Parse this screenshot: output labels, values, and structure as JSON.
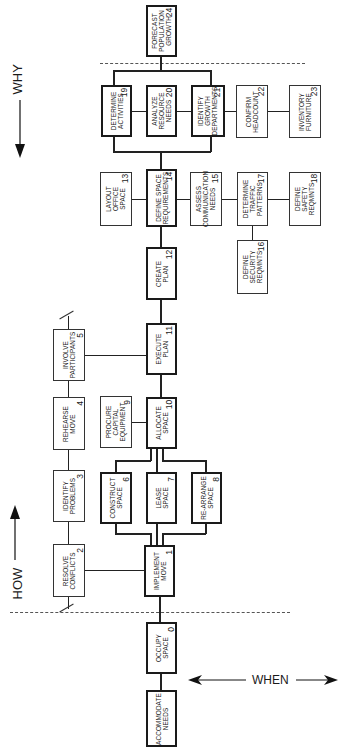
{
  "diagram": {
    "type": "FAST diagram (function analysis)",
    "axis_labels": {
      "how": "HOW",
      "why": "WHY",
      "when": "WHEN"
    },
    "nodes": [
      {
        "id": 24,
        "label_lines": [
          "FORECAST",
          "POPULATION",
          "GROWTH"
        ],
        "num": "24"
      },
      {
        "id": 19,
        "label_lines": [
          "DETERMINE",
          "ACTIVITIES"
        ],
        "num": "19"
      },
      {
        "id": 20,
        "label_lines": [
          "ANALYZE",
          "RESOURCE",
          "NEEDS"
        ],
        "num": "20"
      },
      {
        "id": 21,
        "label_lines": [
          "IDENTIFY",
          "GROWTH",
          "DEPARTMENTS"
        ],
        "num": "21"
      },
      {
        "id": 22,
        "label_lines": [
          "CONFIRM",
          "HEADCOUNT"
        ],
        "num": "22"
      },
      {
        "id": 23,
        "label_lines": [
          "INVENTORY",
          "FURNITURE"
        ],
        "num": "23"
      },
      {
        "id": 13,
        "label_lines": [
          "LAYOUT",
          "OFFICE",
          "SPACE"
        ],
        "num": "13"
      },
      {
        "id": 14,
        "label_lines": [
          "DEFINE SPACE",
          "REQUIREMENTS"
        ],
        "num": "14"
      },
      {
        "id": 15,
        "label_lines": [
          "ASSESS",
          "COMMUNICATION",
          "NEEDS"
        ],
        "num": "15"
      },
      {
        "id": 17,
        "label_lines": [
          "DETERMINE",
          "TRAFFIC",
          "PATTERNS"
        ],
        "num": "17"
      },
      {
        "id": 18,
        "label_lines": [
          "DEFINE",
          "SAFETY",
          "REQMNTS"
        ],
        "num": "18"
      },
      {
        "id": 16,
        "label_lines": [
          "DEFINE",
          "SECURITY",
          "REQMNTS"
        ],
        "num": "16"
      },
      {
        "id": 12,
        "label_lines": [
          "CREATE",
          "PLAN"
        ],
        "num": "12"
      },
      {
        "id": 11,
        "label_lines": [
          "EXECUTE",
          "PLAN"
        ],
        "num": "11"
      },
      {
        "id": 5,
        "label_lines": [
          "INVOLVE",
          "PARTICIPANTS"
        ],
        "num": "5"
      },
      {
        "id": 4,
        "label_lines": [
          "REHEARSE",
          "MOVE"
        ],
        "num": "4"
      },
      {
        "id": 3,
        "label_lines": [
          "IDENTIFY",
          "PROBLEMS"
        ],
        "num": "3"
      },
      {
        "id": 2,
        "label_lines": [
          "RESOLVE",
          "CONFLICTS"
        ],
        "num": "2"
      },
      {
        "id": 9,
        "label_lines": [
          "PROCURE",
          "CAPITAL",
          "EQUIPMENT"
        ],
        "num": "9"
      },
      {
        "id": 10,
        "label_lines": [
          "ALLOCATE",
          "SPACE"
        ],
        "num": "10"
      },
      {
        "id": 6,
        "label_lines": [
          "CONSTRUCT",
          "SPACE"
        ],
        "num": "6"
      },
      {
        "id": 7,
        "label_lines": [
          "LEASE",
          "SPACE"
        ],
        "num": "7"
      },
      {
        "id": 8,
        "label_lines": [
          "RE-ARRANGE",
          "SPACE"
        ],
        "num": "8"
      },
      {
        "id": 1,
        "label_lines": [
          "IMPLEMENT",
          "MOVE"
        ],
        "num": "1"
      },
      {
        "id": 0,
        "label_lines": [
          "OCCUPY",
          "SPACE"
        ],
        "num": "0"
      },
      {
        "id": "basic",
        "label_lines": [
          "ACCOMMODATE",
          "NEEDS"
        ],
        "num": ""
      }
    ],
    "n": {
      "24": {
        "l1": "FORECAST",
        "l2": "POPULATION",
        "l3": "GROWTH",
        "num": "24"
      },
      "19": {
        "l1": "DETERMINE",
        "l2": "ACTIVITIES",
        "num": "19"
      },
      "20": {
        "l1": "ANALYZE",
        "l2": "RESOURCE",
        "l3": "NEEDS",
        "num": "20"
      },
      "21": {
        "l1": "IDENTIFY",
        "l2": "GROWTH",
        "l3": "DEPARTMENTS",
        "num": "21"
      },
      "22": {
        "l1": "CONFIRM",
        "l2": "HEADCOUNT",
        "num": "22"
      },
      "23": {
        "l1": "INVENTORY",
        "l2": "FURNITURE",
        "num": "23"
      },
      "13": {
        "l1": "LAYOUT",
        "l2": "OFFICE",
        "l3": "SPACE",
        "num": "13"
      },
      "14": {
        "l1": "DEFINE SPACE",
        "l2": "REQUIREMENTS",
        "num": "14"
      },
      "15": {
        "l1": "ASSESS",
        "l2": "COMMUNICATION",
        "l3": "NEEDS",
        "num": "15"
      },
      "17": {
        "l1": "DETERMINE",
        "l2": "TRAFFIC",
        "l3": "PATTERNS",
        "num": "17"
      },
      "18": {
        "l1": "DEFINE",
        "l2": "SAFETY",
        "l3": "REQMNTS",
        "num": "18"
      },
      "16": {
        "l1": "DEFINE",
        "l2": "SECURITY",
        "l3": "REQMNTS",
        "num": "16"
      },
      "12": {
        "l1": "CREATE",
        "l2": "PLAN",
        "num": "12"
      },
      "11": {
        "l1": "EXECUTE",
        "l2": "PLAN",
        "num": "11"
      },
      "5": {
        "l1": "INVOLVE",
        "l2": "PARTICIPANTS",
        "num": "5"
      },
      "4": {
        "l1": "REHEARSE",
        "l2": "MOVE",
        "num": "4"
      },
      "3": {
        "l1": "IDENTIFY",
        "l2": "PROBLEMS",
        "num": "3"
      },
      "2": {
        "l1": "RESOLVE",
        "l2": "CONFLICTS",
        "num": "2"
      },
      "9": {
        "l1": "PROCURE",
        "l2": "CAPITAL",
        "l3": "EQUIPMENT",
        "num": "9"
      },
      "10": {
        "l1": "ALLOCATE",
        "l2": "SPACE",
        "num": "10"
      },
      "6": {
        "l1": "CONSTRUCT",
        "l2": "SPACE",
        "num": "6"
      },
      "7": {
        "l1": "LEASE",
        "l2": "SPACE",
        "num": "7"
      },
      "8": {
        "l1": "RE-ARRANGE",
        "l2": "SPACE",
        "num": "8"
      },
      "1": {
        "l1": "IMPLEMENT",
        "l2": "MOVE",
        "num": "1"
      },
      "0": {
        "l1": "OCCUPY",
        "l2": "SPACE",
        "num": "0"
      },
      "basic": {
        "l1": "ACCOMMODATE",
        "l2": "NEEDS"
      }
    }
  }
}
